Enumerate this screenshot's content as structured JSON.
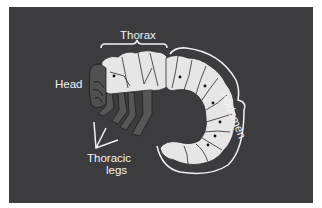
{
  "diagram": {
    "labels": {
      "thorax": "Thorax",
      "head": "Head",
      "abdomen": "Abdomen",
      "thoracic_legs_line1": "Thoracic",
      "thoracic_legs_line2": "legs"
    },
    "colors": {
      "background": "#3c3c3e",
      "page": "#ffffff",
      "body": "#e6e6e6",
      "outline": "#2a2a2a",
      "leg": "#555555",
      "label": "#f2f2f2"
    }
  }
}
